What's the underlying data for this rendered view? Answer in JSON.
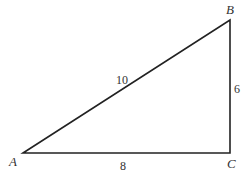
{
  "diagram": {
    "type": "right-triangle",
    "vertices": {
      "A": {
        "label": "A",
        "x": 23,
        "y": 153
      },
      "B": {
        "label": "B",
        "x": 230,
        "y": 20
      },
      "C": {
        "label": "C",
        "x": 230,
        "y": 153
      }
    },
    "sides": {
      "AB": {
        "label": "10"
      },
      "BC": {
        "label": "6"
      },
      "AC": {
        "label": "8"
      }
    },
    "stroke_color": "#222222"
  }
}
